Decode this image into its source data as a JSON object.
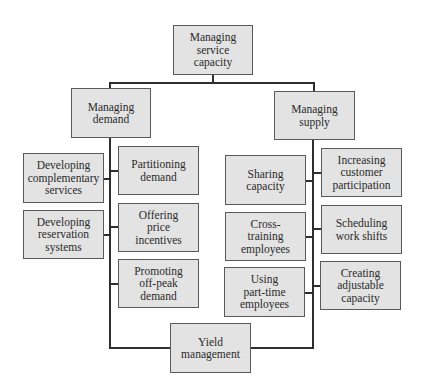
{
  "diagram": {
    "title": "Managing service capacity",
    "root": {
      "label": "Managing\nservice\ncapacity"
    },
    "branches": {
      "demand": {
        "label": "Managing\ndemand",
        "children": [
          {
            "label": "Developing\ncomplementary\nservices"
          },
          {
            "label": "Partitioning\ndemand"
          },
          {
            "label": "Developing\nreservation\nsystems"
          },
          {
            "label": "Offering\nprice\nincentives"
          },
          {
            "label": "Promoting\noff-peak\ndemand"
          }
        ]
      },
      "supply": {
        "label": "Managing\nsupply",
        "children": [
          {
            "label": "Sharing\ncapacity"
          },
          {
            "label": "Increasing\ncustomer\nparticipation"
          },
          {
            "label": "Cross-\ntraining\nemployees"
          },
          {
            "label": "Scheduling\nwork shifts"
          },
          {
            "label": "Using\npart-time\nemployees"
          },
          {
            "label": "Creating\nadjustable\ncapacity"
          }
        ]
      }
    },
    "shared": {
      "label": "Yield\nmanagement"
    },
    "colors": {
      "box_fill": "#e3e3e3",
      "box_border": "#5a5a5a",
      "connector": "#2e2e2e",
      "text": "#2a2a2a"
    }
  }
}
